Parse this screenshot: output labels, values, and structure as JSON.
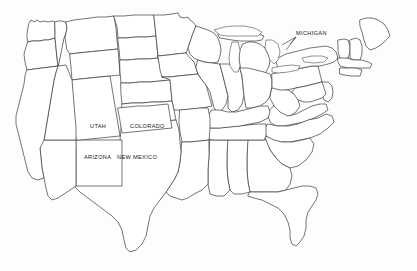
{
  "map": {
    "title": "Outline map of the contiguous United States",
    "background_color": "#fdfdfd",
    "outline_color": "#3a3a3a",
    "label_color": "#151515",
    "fill_color": "#ffffff",
    "width": 417,
    "height": 271,
    "labels": [
      {
        "id": "michigan",
        "text": "MICHIGAN",
        "x": 296,
        "y": 31,
        "has_leader_line": true
      },
      {
        "id": "utah",
        "text": "UTAH",
        "x": 90,
        "y": 124,
        "has_leader_line": false
      },
      {
        "id": "colorado",
        "text": "COLORADO",
        "x": 130,
        "y": 124,
        "has_leader_line": false
      },
      {
        "id": "arizona",
        "text": "ARIZONA",
        "x": 84,
        "y": 155,
        "has_leader_line": false
      },
      {
        "id": "new_mexico",
        "text": "NEW MEXICO",
        "x": 117,
        "y": 155,
        "has_leader_line": false
      }
    ]
  }
}
